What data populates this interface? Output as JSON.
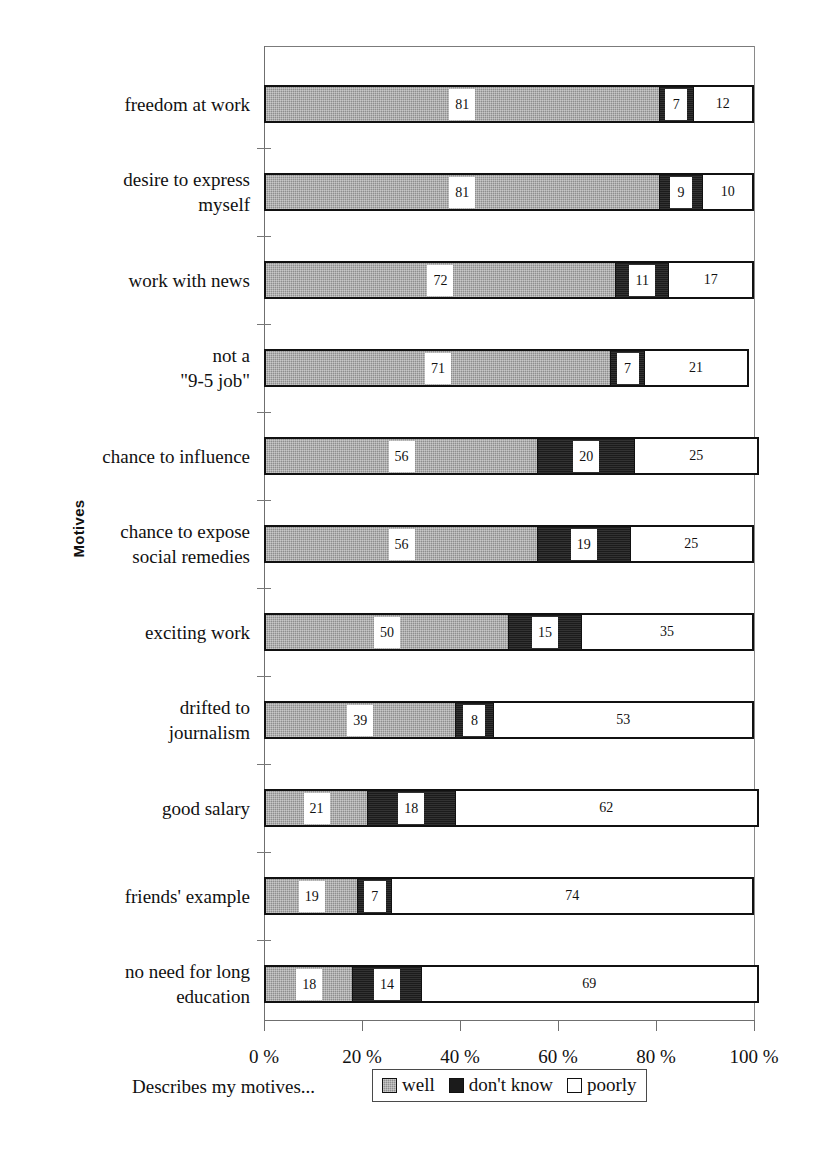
{
  "chart_data": {
    "type": "bar",
    "subtype": "stacked-horizontal-100",
    "title": "",
    "xlabel": "Describes my motives...",
    "ylabel": "Motives",
    "xlim": [
      0,
      100
    ],
    "xticks": [
      0,
      20,
      40,
      60,
      80,
      100
    ],
    "xtick_labels": [
      "0 %",
      "20 %",
      "40 %",
      "60 %",
      "80 %",
      "100 %"
    ],
    "grid": false,
    "legend_position": "bottom",
    "legend": [
      "well",
      "don't know",
      "poorly"
    ],
    "colors": {
      "well": "#8e8e8e",
      "dont_know": "#1b1b1b",
      "poorly": "#ffffff",
      "outline": "#111111"
    },
    "categories": [
      "freedom at work",
      "desire to express myself",
      "work with news",
      "not a \"9-5 job\"",
      "chance to influence",
      "chance to expose social remedies",
      "exciting work",
      "drifted to journalism",
      "good salary",
      "friends' example",
      "no need for long education"
    ],
    "series": [
      {
        "name": "well",
        "values": [
          81,
          81,
          72,
          71,
          56,
          56,
          50,
          39,
          21,
          19,
          18
        ]
      },
      {
        "name": "don't know",
        "values": [
          7,
          9,
          11,
          7,
          20,
          19,
          15,
          8,
          18,
          7,
          14
        ]
      },
      {
        "name": "poorly",
        "values": [
          12,
          10,
          17,
          21,
          25,
          25,
          35,
          53,
          62,
          74,
          69
        ]
      }
    ]
  },
  "axis": {
    "y_title": "Motives",
    "x_caption": "Describes my motives..."
  },
  "categories_display": [
    {
      "line1": "freedom at work",
      "line2": ""
    },
    {
      "line1": "desire to express",
      "line2": "myself"
    },
    {
      "line1": "work with news",
      "line2": ""
    },
    {
      "line1": "not a",
      "line2": "\"9-5 job\""
    },
    {
      "line1": "chance to influence",
      "line2": ""
    },
    {
      "line1": "chance to expose",
      "line2": "social remedies"
    },
    {
      "line1": "exciting work",
      "line2": ""
    },
    {
      "line1": "drifted to",
      "line2": "journalism"
    },
    {
      "line1": "good salary",
      "line2": ""
    },
    {
      "line1": "friends' example",
      "line2": ""
    },
    {
      "line1": "no need for long",
      "line2": "education"
    }
  ],
  "legend": {
    "items": [
      {
        "label": "well"
      },
      {
        "label": "don't know"
      },
      {
        "label": "poorly"
      }
    ]
  },
  "xticks": [
    {
      "label": "0 %",
      "value": 0
    },
    {
      "label": "20 %",
      "value": 20
    },
    {
      "label": "40 %",
      "value": 40
    },
    {
      "label": "60 %",
      "value": 60
    },
    {
      "label": "80 %",
      "value": 80
    },
    {
      "label": "100 %",
      "value": 100
    }
  ]
}
